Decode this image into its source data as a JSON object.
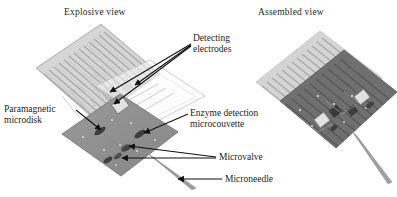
{
  "figure": {
    "background_color": "#ffffff",
    "views": [
      {
        "id": "explosive",
        "title": "Explosive view"
      },
      {
        "id": "assembled",
        "title": "Assembled view"
      }
    ],
    "callouts": [
      {
        "id": "detecting",
        "line1": "Detecting",
        "line2": "electrodes",
        "arrows": 3
      },
      {
        "id": "paramagnetic",
        "line1": "Paramagnetic",
        "line2": "microdisk",
        "arrows": 1
      },
      {
        "id": "enzyme",
        "line1": "Enzyme detection",
        "line2": "microcouvette",
        "arrows": 1
      },
      {
        "id": "microvalve",
        "line1": "Microvalve",
        "line2": "",
        "arrows": 2
      },
      {
        "id": "microneedle",
        "line1": "Microneedle",
        "line2": "",
        "arrows": 1
      }
    ],
    "colors": {
      "label_text": "#1c1c1c",
      "title_text": "#262626",
      "arrow": "#111111",
      "electrode_layer": "#cfcfcf",
      "electrode_finger": "#b4b4b4",
      "chip_body": "#8f8f8f",
      "chip_dark_feature": "#3a3a3a",
      "chip_light_pad": "#e2e2e2",
      "assembled_light_half": "#d2d2d2",
      "assembled_dark_half": "#6f6f6f",
      "needle": "#9a9a9a",
      "ghost_outline": "#c8c8c8"
    }
  }
}
